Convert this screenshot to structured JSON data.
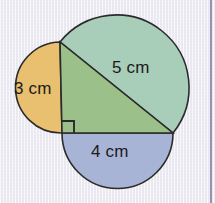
{
  "figure": {
    "canvas": {
      "width": 215,
      "height": 203
    },
    "background_color": "#f2f0f6",
    "margin_rule_color": "#7e7290",
    "stroke_color": "#2b2b2b",
    "stroke_width": 1.6,
    "triangle": {
      "name": "right-triangle-3-4-5",
      "fill": "#9bc08a",
      "vertices": {
        "top": {
          "x": 60,
          "y": 42
        },
        "right_angle": {
          "x": 62,
          "y": 133
        },
        "right": {
          "x": 173,
          "y": 133
        }
      },
      "right_angle_marker": {
        "size": 12,
        "corner_x": 62,
        "corner_y": 133
      }
    },
    "semicircles": [
      {
        "name": "semicircle-on-leg-a",
        "side": "vertical-leg",
        "fill": "#e8c070",
        "center": {
          "x": 61,
          "y": 87.5
        },
        "radius": 45.5,
        "orientation": "left"
      },
      {
        "name": "semicircle-on-hypotenuse",
        "side": "hypotenuse",
        "fill": "#a8cdb8",
        "center": {
          "x": 116.5,
          "y": 87.5
        },
        "radius": 72.5,
        "orientation": "upper-right"
      },
      {
        "name": "semicircle-on-leg-b",
        "side": "horizontal-leg",
        "fill": "#a8b4d6",
        "center": {
          "x": 117.5,
          "y": 133
        },
        "radius": 55.5,
        "orientation": "down"
      }
    ],
    "labels": {
      "leg_vertical": "3 cm",
      "hypotenuse": "5 cm",
      "leg_horizontal": "4 cm"
    }
  }
}
